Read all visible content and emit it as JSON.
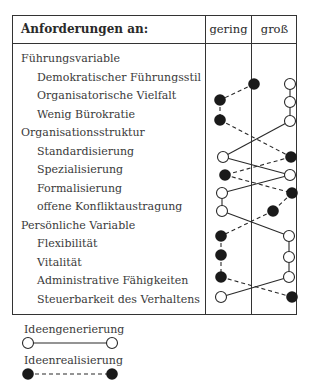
{
  "header": {
    "title": "Anforderungen an:",
    "col_low": "gering",
    "col_high": "groß"
  },
  "rows": [
    {
      "label": "Führungsvariable",
      "type": "category"
    },
    {
      "label": "Demokratischer Führungsstil",
      "type": "item",
      "generation": "groß",
      "realization": "groß-left"
    },
    {
      "label": "Organisatorische Vielfalt",
      "type": "item",
      "generation": "groß",
      "realization": "gering"
    },
    {
      "label": "Wenig Bürokratie",
      "type": "item",
      "generation": "groß",
      "realization": "gering"
    },
    {
      "label": "Organisationsstruktur",
      "type": "category"
    },
    {
      "label": "Standardisierung",
      "type": "item",
      "generation": "gering",
      "realization": "groß"
    },
    {
      "label": "Spezialisierung",
      "type": "item",
      "generation": "groß",
      "realization": "gering"
    },
    {
      "label": "Formalisierung",
      "type": "item",
      "generation": "gering",
      "realization": "groß"
    },
    {
      "label": "offene Konfliktaustragung",
      "type": "item",
      "generation": "gering",
      "realization": "groß"
    },
    {
      "label": "Persönliche Variable",
      "type": "category"
    },
    {
      "label": "Flexibilität",
      "type": "item",
      "generation": "groß",
      "realization": "gering"
    },
    {
      "label": "Vitalität",
      "type": "item",
      "generation": "groß",
      "realization": "gering"
    },
    {
      "label": "Administrative Fähigkeiten",
      "type": "item",
      "generation": "groß",
      "realization": "gering"
    },
    {
      "label": "Steuerbarkeit des Verhaltens",
      "type": "item",
      "generation": "gering",
      "realization": "groß"
    }
  ],
  "series": {
    "generation": {
      "name": "Ideengenerierung",
      "style": "solid",
      "marker": "open-circle",
      "points": [
        [
          290,
          84
        ],
        [
          290,
          102
        ],
        [
          290,
          121
        ],
        [
          223,
          157
        ],
        [
          290,
          175
        ],
        [
          222,
          193
        ],
        [
          222,
          211
        ],
        [
          289,
          236
        ],
        [
          289,
          257
        ],
        [
          289,
          277
        ],
        [
          221,
          297
        ]
      ]
    },
    "realization": {
      "name": "Ideenrealisierung",
      "style": "dashed",
      "marker": "filled-circle",
      "points": [
        [
          254,
          84
        ],
        [
          220,
          100
        ],
        [
          220,
          120
        ],
        [
          291,
          157
        ],
        [
          225,
          175
        ],
        [
          292,
          193
        ],
        [
          273,
          211
        ],
        [
          221,
          236
        ],
        [
          221,
          255
        ],
        [
          221,
          277
        ],
        [
          292,
          297
        ]
      ]
    }
  },
  "legend": {
    "generation_label": "Ideengenerierung",
    "realization_label": "Ideenrealisierung"
  },
  "colors": {
    "line": "#2a2a2a",
    "fill": "#1a1a1a",
    "border": "#333333"
  }
}
